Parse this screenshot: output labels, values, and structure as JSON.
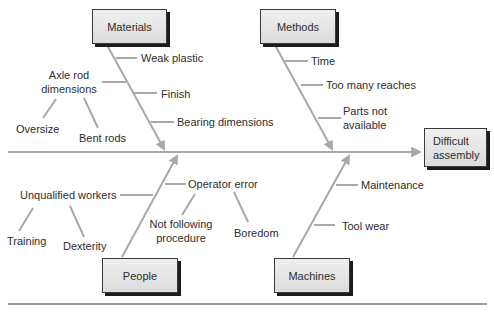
{
  "effect": {
    "label": "Difficult assembly",
    "line1": "Difficult",
    "line2": "assembly"
  },
  "categories": {
    "materials": {
      "label": "Materials",
      "causes": [
        "Weak plastic",
        "Axle rod dimensions",
        "Finish",
        "Bearing dimensions"
      ],
      "axle_rod": {
        "line1": "Axle rod",
        "line2": "dimensions",
        "sub_causes": [
          "Oversize",
          "Bent rods"
        ]
      }
    },
    "methods": {
      "label": "Methods",
      "causes": [
        "Time",
        "Too many reaches",
        "Parts not available"
      ],
      "parts_line1": "Parts not",
      "parts_line2": "available"
    },
    "people": {
      "label": "People",
      "causes": [
        "Unqualified workers",
        "Operator error"
      ],
      "unqualified_sub": [
        "Training",
        "Dexterity"
      ],
      "operator_sub": [
        "Not following procedure",
        "Boredom"
      ],
      "nfp_line1": "Not following",
      "nfp_line2": "procedure"
    },
    "machines": {
      "label": "Machines",
      "causes": [
        "Maintenance",
        "Tool wear"
      ]
    }
  },
  "colors": {
    "bone": "#a8a8a8",
    "box_fill": "#e6e6e6",
    "box_shadow": "#1c1c1c",
    "text": "#2e2e2e",
    "rule": "#333333"
  }
}
